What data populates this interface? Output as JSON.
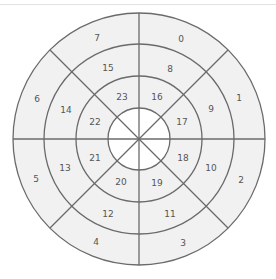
{
  "diagram": {
    "type": "segmented-polar-grid",
    "center": [
      139,
      139
    ],
    "ring_radii": [
      31,
      63,
      95,
      126
    ],
    "sectors": 8,
    "colors": {
      "fill": "#f1f1f1",
      "hub": "#ffffff",
      "stroke": "#6a6a6a",
      "label": "#555555"
    },
    "rings": [
      {
        "name": "outer",
        "labels": [
          "0",
          "1",
          "2",
          "3",
          "4",
          "5",
          "6",
          "7"
        ]
      },
      {
        "name": "middle",
        "labels": [
          "8",
          "9",
          "10",
          "11",
          "12",
          "13",
          "14",
          "15"
        ]
      },
      {
        "name": "inner",
        "labels": [
          "16",
          "17",
          "18",
          "19",
          "20",
          "21",
          "22",
          "23"
        ]
      }
    ]
  },
  "labels": {
    "s0": "0",
    "s1": "1",
    "s2": "2",
    "s3": "3",
    "s4": "4",
    "s5": "5",
    "s6": "6",
    "s7": "7",
    "s8": "8",
    "s9": "9",
    "s10": "10",
    "s11": "11",
    "s12": "12",
    "s13": "13",
    "s14": "14",
    "s15": "15",
    "s16": "16",
    "s17": "17",
    "s18": "18",
    "s19": "19",
    "s20": "20",
    "s21": "21",
    "s22": "22",
    "s23": "23"
  }
}
